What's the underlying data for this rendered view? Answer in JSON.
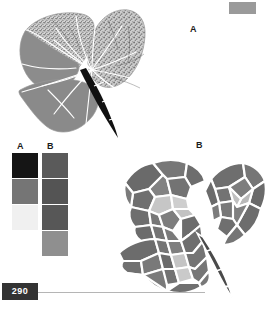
{
  "page": {
    "number": "290",
    "background_color": "#ffffff",
    "corner_marker_color": "#9a9a9a",
    "footer_rule_color": "#b5b5b5",
    "badge_color": "#333333"
  },
  "panels": [
    {
      "id": "panel-a",
      "label": "A",
      "description": "leaf diagram with textured and solid shaded regions separated by white vein lines and a dark petiole"
    },
    {
      "id": "panel-b",
      "label": "B",
      "description": "leaf diagram subdivided into polygonal cells of varying gray values separated by white boundary lines"
    }
  ],
  "legend": {
    "columns": [
      {
        "label": "A",
        "swatches": [
          {
            "color": "#151515"
          },
          {
            "color": "#757575"
          },
          {
            "color": "#f0f0f0"
          }
        ]
      },
      {
        "label": "B",
        "swatches": [
          {
            "color": "#5a5a5a"
          },
          {
            "color": "#545454"
          },
          {
            "color": "#575757"
          },
          {
            "color": "#8f8f8f"
          }
        ]
      }
    ]
  },
  "figure_a": {
    "vein_color": "#ffffff",
    "outline_color": "#8a8a8a",
    "petiole_color": "#111111",
    "texture_fill": "#cfcfcf",
    "texture_speckle": "#6e6e6e",
    "solid_fill": "#8c8c8c",
    "regions": [
      {
        "name": "upper-left-lobe",
        "fill": "texture"
      },
      {
        "name": "upper-right-lobe",
        "fill": "texture"
      },
      {
        "name": "left-lobe",
        "fill": "solid"
      },
      {
        "name": "lower-lobe",
        "fill": "solid"
      },
      {
        "name": "petiole",
        "fill": "petiole"
      }
    ]
  },
  "figure_b": {
    "boundary_color": "#ffffff",
    "petiole_color": "#3a3a3a",
    "cell_fills": {
      "dark": "#666666",
      "medium": "#7e7e7e",
      "light": "#c9c9c9",
      "lighter": "#b6b6b6"
    }
  }
}
